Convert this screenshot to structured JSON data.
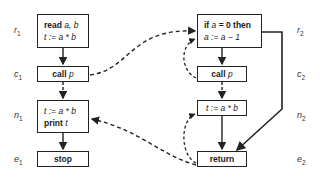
{
  "nodes": {
    "r1": {
      "label": "r",
      "sub": "1",
      "lines": [
        {
          "kw": "read ",
          "var": "a, b"
        },
        {
          "kw": "",
          "var": "t := a * b"
        }
      ]
    },
    "c1": {
      "label": "c",
      "sub": "1",
      "kw": "call ",
      "var": "p"
    },
    "n1": {
      "label": "n",
      "sub": "1",
      "lines": [
        {
          "kw": "",
          "var": "t := a * b"
        },
        {
          "kw": "print ",
          "var": "t"
        }
      ]
    },
    "e1": {
      "label": "e",
      "sub": "1",
      "kw": "stop"
    },
    "r2": {
      "label": "r",
      "sub": "2",
      "lines": [
        {
          "kw": "if ",
          "var": "a",
          "rest": " = 0 then"
        },
        {
          "kw": "",
          "var": "a := a − 1"
        }
      ]
    },
    "c2": {
      "label": "c",
      "sub": "2",
      "kw": "call ",
      "var": "p"
    },
    "n2": {
      "label": "n",
      "sub": "2",
      "var": "t := a * b"
    },
    "e2": {
      "label": "e",
      "sub": "2",
      "kw": "return"
    }
  },
  "edges": [
    {
      "from": "r1",
      "to": "c1",
      "style": "solid"
    },
    {
      "from": "c1",
      "to": "n1",
      "style": "dashed"
    },
    {
      "from": "n1",
      "to": "e1",
      "style": "solid"
    },
    {
      "from": "c1",
      "to": "r2",
      "style": "dashed"
    },
    {
      "from": "e2",
      "to": "n1",
      "style": "dashed"
    },
    {
      "from": "r2",
      "to": "c2",
      "style": "solid"
    },
    {
      "from": "c2",
      "to": "n2",
      "style": "dashed"
    },
    {
      "from": "n2",
      "to": "e2",
      "style": "solid"
    },
    {
      "from": "r2",
      "to": "e2",
      "style": "solid"
    },
    {
      "from": "c2",
      "to": "r2",
      "style": "dashed"
    },
    {
      "from": "e2",
      "to": "n2",
      "style": "dashed"
    }
  ],
  "colors": {
    "stroke": "#222222",
    "background": "#ffffff"
  }
}
